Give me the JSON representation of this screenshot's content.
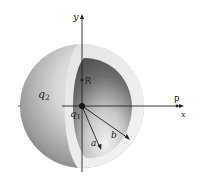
{
  "figure": {
    "axes": {
      "x_label": "x",
      "y_label": "y"
    },
    "charges": {
      "inner": {
        "symbol": "q",
        "subscript": "1"
      },
      "shell": {
        "symbol": "q",
        "subscript": "2"
      }
    },
    "points": {
      "R": "R",
      "P": "P"
    },
    "radii": {
      "inner": "a",
      "outer": "b"
    },
    "colors": {
      "background": "#ffffff",
      "shell_outer_light": "#f2f2f2",
      "shell_outer_dark": "#7d7d7d",
      "cavity_dark": "#5a5a5a",
      "cavity_light": "#eeeeee",
      "lines": "#222222"
    }
  }
}
